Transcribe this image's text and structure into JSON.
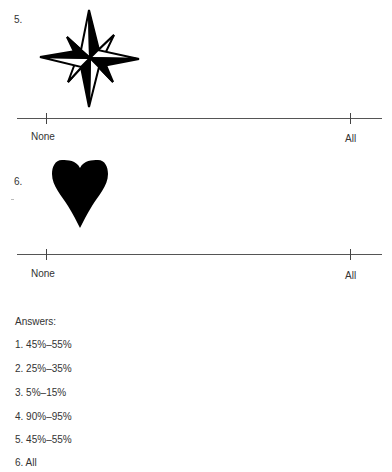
{
  "questions": [
    {
      "number": "5.",
      "figure": "compass-rose-star-icon",
      "scale": {
        "left_label": "None",
        "right_label": "All"
      }
    },
    {
      "number": "6.",
      "figure": "heart-icon",
      "scale": {
        "left_label": "None",
        "right_label": "All"
      }
    }
  ],
  "answers": {
    "title": "Answers:",
    "items": [
      "1. 45%–55%",
      "2. 25%–35%",
      "3. 5%–15%",
      "4. 90%–95%",
      "5. 45%–55%",
      "6. All"
    ]
  }
}
